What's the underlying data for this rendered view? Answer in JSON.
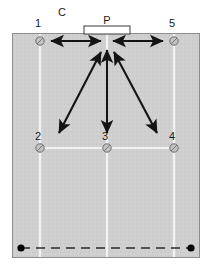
{
  "diagram": {
    "title_label": "C",
    "goal_label": "P",
    "background_color": "#ffffff",
    "field_color": "#cfcfcf",
    "field_border_color": "#8d8d8d",
    "line_color": "#f2f2f2",
    "arrow_color": "#141414",
    "marker_color": "#c3c3c3",
    "marker_outline_color": "#6e6e6e",
    "dot_color": "#000000",
    "dash_color": "#2b2b2b"
  },
  "field": {
    "x": 12,
    "y": 33,
    "width": 188,
    "height": 225
  },
  "vertical_lines": [
    {
      "name": "left-lane-line",
      "x": 40
    },
    {
      "name": "center-lane-line",
      "x": 107
    },
    {
      "name": "right-lane-line",
      "x": 174
    }
  ],
  "horizontal_lines": [
    {
      "name": "mid-field-line",
      "y": 148,
      "x1": 40,
      "x2": 174
    }
  ],
  "goal": {
    "label": "P",
    "x": 84,
    "y": 26,
    "width": 46,
    "height": 8,
    "label_x": 107,
    "label_y": 24
  },
  "markers": [
    {
      "id": "1",
      "label": "1",
      "x": 40,
      "y": 41,
      "label_x": 38,
      "label_y": 27
    },
    {
      "id": "5",
      "label": "5",
      "x": 174,
      "y": 41,
      "label_x": 172,
      "label_y": 27
    },
    {
      "id": "2",
      "label": "2",
      "x": 40,
      "y": 148,
      "label_x": 38,
      "label_y": 140
    },
    {
      "id": "3",
      "label": "3",
      "x": 107,
      "y": 148,
      "label_x": 105,
      "label_y": 140
    },
    {
      "id": "4",
      "label": "4",
      "x": 174,
      "y": 148,
      "label_x": 172,
      "label_y": 140
    }
  ],
  "arrows": [
    {
      "name": "arrow-1-to-P",
      "x1": 51,
      "y1": 41,
      "x2": 101,
      "y2": 41,
      "double": true
    },
    {
      "name": "arrow-5-to-P",
      "x1": 163,
      "y1": 41,
      "x2": 113,
      "y2": 41,
      "double": true
    },
    {
      "name": "arrow-2-to-P",
      "x1": 59,
      "y1": 133,
      "x2": 101,
      "y2": 52,
      "double": true
    },
    {
      "name": "arrow-3-to-P",
      "x1": 107,
      "y1": 133,
      "x2": 107,
      "y2": 50,
      "double": true
    },
    {
      "name": "arrow-4-to-P",
      "x1": 157,
      "y1": 133,
      "x2": 114,
      "y2": 52,
      "double": true
    }
  ],
  "baseline": {
    "name": "dashed-baseline",
    "y": 248,
    "x1": 21,
    "x2": 191,
    "dash_pattern": "9 6",
    "end_dots": [
      {
        "name": "baseline-dot-left",
        "x": 21,
        "y": 248,
        "r": 3.6
      },
      {
        "name": "baseline-dot-right",
        "x": 191,
        "y": 248,
        "r": 3.6
      }
    ]
  },
  "chart_data": {
    "type": "diagram",
    "title": "C",
    "nodes": [
      {
        "label": "P",
        "role": "goal-position",
        "x": 107,
        "y": 34
      },
      {
        "label": "1",
        "role": "cone",
        "x": 40,
        "y": 41
      },
      {
        "label": "5",
        "role": "cone",
        "x": 174,
        "y": 41
      },
      {
        "label": "2",
        "role": "cone",
        "x": 40,
        "y": 148
      },
      {
        "label": "3",
        "role": "cone",
        "x": 107,
        "y": 148
      },
      {
        "label": "4",
        "role": "cone",
        "x": 174,
        "y": 148
      }
    ],
    "edges": [
      {
        "from": "1",
        "to": "P",
        "style": "double-arrow"
      },
      {
        "from": "5",
        "to": "P",
        "style": "double-arrow"
      },
      {
        "from": "2",
        "to": "P",
        "style": "double-arrow"
      },
      {
        "from": "3",
        "to": "P",
        "style": "double-arrow"
      },
      {
        "from": "4",
        "to": "P",
        "style": "double-arrow"
      }
    ]
  }
}
